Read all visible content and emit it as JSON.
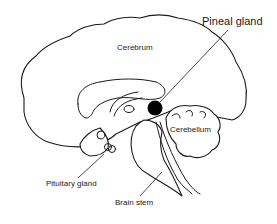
{
  "diagram": {
    "labels": {
      "pineal_gland": "Pineal gland",
      "cerebrum": "Cerebrum",
      "cerebellum": "Cerebellum",
      "pituitary_gland": "Pituitary gland",
      "brain_stem": "Brain stem"
    },
    "colors": {
      "stroke": "#1a1a1a",
      "background": "#ffffff",
      "pineal_fill": "#000000"
    }
  }
}
